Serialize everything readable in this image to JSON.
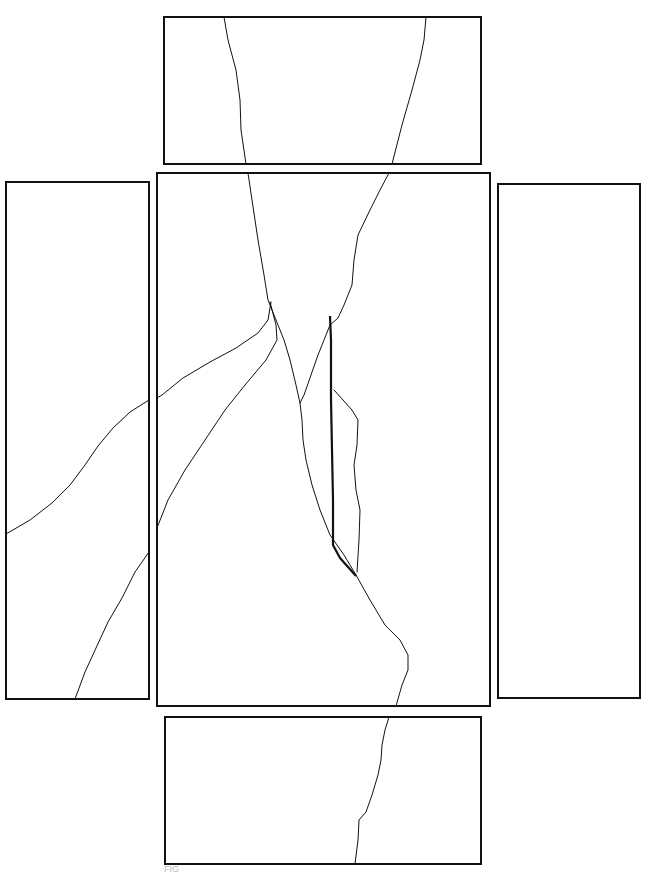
{
  "figure": {
    "label": "FIG",
    "panels": [
      {
        "name": "top",
        "x": 164,
        "y": 17,
        "w": 317,
        "h": 147
      },
      {
        "name": "left",
        "x": 6,
        "y": 182,
        "w": 143,
        "h": 517
      },
      {
        "name": "center",
        "x": 157,
        "y": 173,
        "w": 333,
        "h": 533
      },
      {
        "name": "right",
        "x": 498,
        "y": 184,
        "w": 142,
        "h": 514
      },
      {
        "name": "bottom",
        "x": 165,
        "y": 717,
        "w": 316,
        "h": 147
      }
    ],
    "stroke_color": "#111111",
    "background": "#ffffff"
  }
}
